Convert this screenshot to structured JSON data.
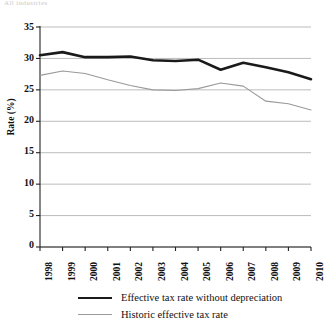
{
  "top_text": "All industries",
  "axes": {
    "ylabel": "Rate (%)",
    "yticks": [
      35,
      30,
      25,
      20,
      15,
      10,
      5,
      0
    ],
    "xticks": [
      "1998",
      "1999",
      "2000",
      "2001",
      "2002",
      "2003",
      "2004",
      "2005",
      "2006",
      "2007",
      "2008",
      "2009",
      "2010"
    ]
  },
  "legend": {
    "items": [
      {
        "label": "Effective tax rate without depreciation",
        "style": "thick",
        "color": "#1a1a1a"
      },
      {
        "label": "Historic effective tax rate",
        "style": "thin",
        "color": "#9a9a9a"
      }
    ]
  },
  "colors": {
    "series_thick": "#1a1a1a",
    "series_thin": "#9a9a9a",
    "gridline": "#b4b4b4",
    "axis": "#222222"
  },
  "chart_data": {
    "type": "line",
    "title": "",
    "xlabel": "",
    "ylabel": "Rate (%)",
    "ylim": [
      0,
      35
    ],
    "ytick_step": 5,
    "grid": true,
    "legend_position": "bottom",
    "x": [
      "1998",
      "1999",
      "2000",
      "2001",
      "2002",
      "2003",
      "2004",
      "2005",
      "2006",
      "2007",
      "2008",
      "2009",
      "2010"
    ],
    "series": [
      {
        "name": "Effective tax rate without depreciation",
        "color": "#1a1a1a",
        "linewidth": 2.6,
        "values": [
          30.5,
          31.0,
          30.2,
          30.2,
          30.3,
          29.7,
          29.6,
          29.8,
          28.2,
          29.3,
          28.6,
          27.8,
          26.7
        ]
      },
      {
        "name": "Historic effective tax rate",
        "color": "#9a9a9a",
        "linewidth": 1.1,
        "values": [
          27.3,
          28.0,
          27.6,
          26.6,
          25.7,
          25.0,
          24.9,
          25.2,
          26.1,
          25.6,
          23.2,
          22.8,
          21.8
        ]
      }
    ]
  }
}
